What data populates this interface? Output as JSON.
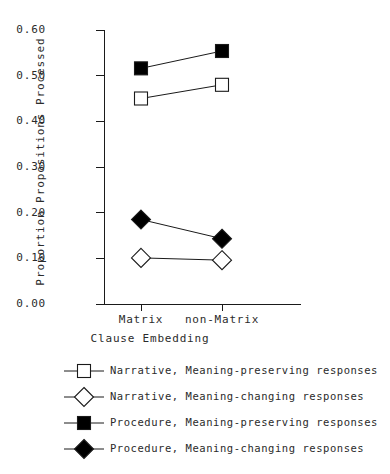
{
  "chart_data": {
    "type": "line",
    "title": "",
    "xlabel": "Clause Embedding",
    "ylabel": "Proportion Propositions Processed",
    "categories": [
      "Matrix",
      "non-Matrix"
    ],
    "ylim": [
      0.0,
      0.6
    ],
    "yticks": [
      "0.00",
      "0.10",
      "0.20",
      "0.30",
      "0.40",
      "0.50",
      "0.60"
    ],
    "ytick_values": [
      0.0,
      0.1,
      0.2,
      0.3,
      0.4,
      0.5,
      0.6
    ],
    "grid": false,
    "legend_position": "bottom",
    "series": [
      {
        "name": "Narrative, Meaning-preserving responses",
        "marker": "open-square",
        "values": [
          0.45,
          0.48
        ]
      },
      {
        "name": "Narrative, Meaning-changing responses",
        "marker": "open-diamond",
        "values": [
          0.101,
          0.096
        ]
      },
      {
        "name": "Procedure, Meaning-preserving responses",
        "marker": "filled-square",
        "values": [
          0.516,
          0.554
        ]
      },
      {
        "name": "Procedure, Meaning-changing responses",
        "marker": "filled-diamond",
        "values": [
          0.185,
          0.143
        ]
      }
    ]
  },
  "colors": {
    "ink": "#1a1a1a",
    "text": "#2b2b2b",
    "fill_open": "#ffffff",
    "fill_solid": "#000000",
    "background": "#ffffff"
  },
  "legend": [
    {
      "label": "Narrative, Meaning-preserving responses",
      "marker": "open-square"
    },
    {
      "label": "Narrative, Meaning-changing responses",
      "marker": "open-diamond"
    },
    {
      "label": "Procedure, Meaning-preserving responses",
      "marker": "filled-square"
    },
    {
      "label": "Procedure, Meaning-changing responses",
      "marker": "filled-diamond"
    }
  ]
}
